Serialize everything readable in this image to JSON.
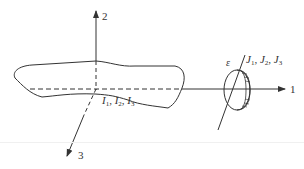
{
  "diagram": {
    "axes": {
      "axis1": {
        "label": "1"
      },
      "axis2": {
        "label": "2"
      },
      "axis3": {
        "label": "3"
      }
    },
    "body_label": {
      "symbol": "I",
      "parts": [
        "I1",
        "I2",
        "I3"
      ],
      "sep": ", ",
      "subs": [
        "1",
        "2",
        "3"
      ]
    },
    "rotor_label": {
      "symbol": "J",
      "subs": [
        "1",
        "2",
        "3"
      ]
    },
    "angle_label": "ε",
    "colors": {
      "stroke": "#333333",
      "background": "#ffffff"
    }
  }
}
